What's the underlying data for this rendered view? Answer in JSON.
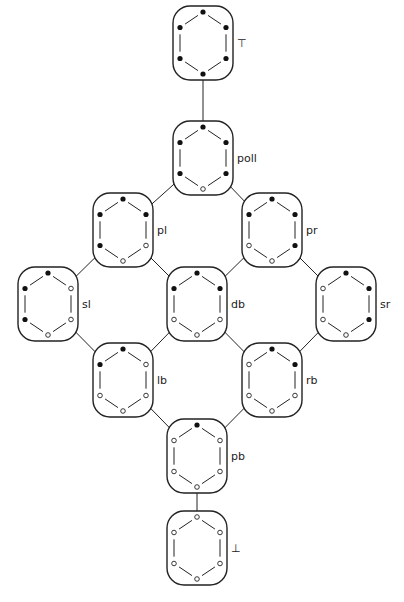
{
  "diagram": {
    "type": "lattice",
    "dot_order": [
      "top",
      "upper-right",
      "lower-right",
      "bottom",
      "lower-left",
      "upper-left"
    ],
    "colors": {
      "stroke": "#222222",
      "filled": "#111111",
      "open": "#ffffff",
      "background": "#ffffff"
    },
    "nodes": [
      {
        "id": "top",
        "label": "⊤",
        "cx": 203,
        "cy": 43,
        "dots": [
          1,
          1,
          1,
          1,
          1,
          1
        ]
      },
      {
        "id": "poll",
        "label": "poll",
        "cx": 203,
        "cy": 158,
        "dots": [
          1,
          1,
          1,
          0,
          1,
          1
        ]
      },
      {
        "id": "pl",
        "label": "pl",
        "cx": 123,
        "cy": 230,
        "dots": [
          1,
          1,
          0,
          0,
          1,
          1
        ]
      },
      {
        "id": "pr",
        "label": "pr",
        "cx": 272,
        "cy": 230,
        "dots": [
          1,
          1,
          1,
          0,
          0,
          1
        ]
      },
      {
        "id": "sl",
        "label": "sl",
        "cx": 48,
        "cy": 304,
        "dots": [
          1,
          0,
          0,
          0,
          1,
          1
        ]
      },
      {
        "id": "db",
        "label": "db",
        "cx": 197,
        "cy": 304,
        "dots": [
          1,
          1,
          0,
          0,
          0,
          1
        ]
      },
      {
        "id": "sr",
        "label": "sr",
        "cx": 346,
        "cy": 304,
        "dots": [
          1,
          1,
          1,
          0,
          0,
          0
        ]
      },
      {
        "id": "lb",
        "label": "lb",
        "cx": 123,
        "cy": 380,
        "dots": [
          1,
          0,
          0,
          0,
          0,
          1
        ]
      },
      {
        "id": "rb",
        "label": "rb",
        "cx": 272,
        "cy": 380,
        "dots": [
          1,
          1,
          0,
          0,
          0,
          0
        ]
      },
      {
        "id": "pb",
        "label": "pb",
        "cx": 197,
        "cy": 456,
        "dots": [
          1,
          0,
          0,
          0,
          0,
          0
        ]
      },
      {
        "id": "bot",
        "label": "⊥",
        "cx": 197,
        "cy": 548,
        "dots": [
          0,
          0,
          0,
          0,
          0,
          0
        ]
      }
    ],
    "edges": [
      [
        "top",
        "poll"
      ],
      [
        "poll",
        "pl"
      ],
      [
        "poll",
        "pr"
      ],
      [
        "pl",
        "sl"
      ],
      [
        "pl",
        "db"
      ],
      [
        "pr",
        "db"
      ],
      [
        "pr",
        "sr"
      ],
      [
        "sl",
        "lb"
      ],
      [
        "db",
        "lb"
      ],
      [
        "db",
        "rb"
      ],
      [
        "sr",
        "rb"
      ],
      [
        "lb",
        "pb"
      ],
      [
        "rb",
        "pb"
      ],
      [
        "pb",
        "bot"
      ]
    ]
  }
}
